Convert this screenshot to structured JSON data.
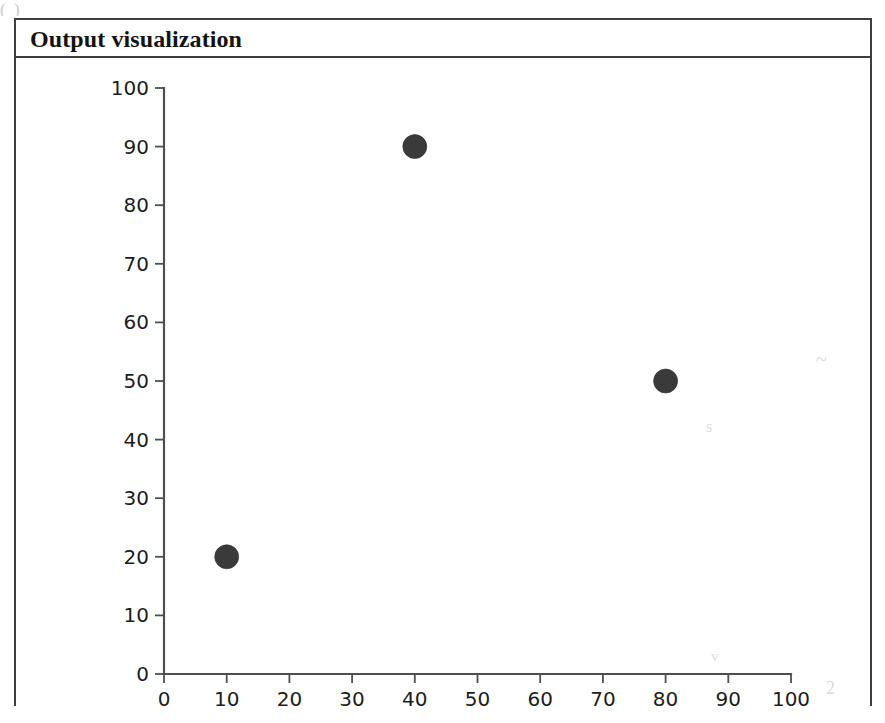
{
  "page": {
    "scan_artifact_top": "(                    )"
  },
  "figure": {
    "title": "Output visualization"
  },
  "smudges": [
    {
      "text": "~",
      "left": 800,
      "top": 290,
      "size": 20
    },
    {
      "text": "s",
      "left": 690,
      "top": 360,
      "size": 16
    },
    {
      "text": "v",
      "left": 695,
      "top": 590,
      "size": 15
    },
    {
      "text": "2",
      "left": 810,
      "top": 620,
      "size": 18
    }
  ],
  "chart_data": {
    "type": "scatter",
    "title": "Output visualization",
    "xlabel": "",
    "ylabel": "",
    "xlim": [
      0,
      100
    ],
    "ylim": [
      0,
      100
    ],
    "grid": false,
    "legend": null,
    "xticks": [
      0,
      10,
      20,
      30,
      40,
      50,
      60,
      70,
      80,
      90,
      100
    ],
    "yticks": [
      0,
      10,
      20,
      30,
      40,
      50,
      60,
      70,
      80,
      90,
      100
    ],
    "xtick_labels": [
      "0",
      "10",
      "20",
      "30",
      "40",
      "50",
      "60",
      "70",
      "80",
      "90",
      "100"
    ],
    "ytick_labels": [
      "0",
      "10",
      "20",
      "30",
      "40",
      "50",
      "60",
      "70",
      "80",
      "90",
      "100"
    ],
    "marker": "circle",
    "marker_color": "#3a3a3a",
    "marker_size": 24,
    "series": [
      {
        "name": "points",
        "points": [
          {
            "x": 10,
            "y": 20
          },
          {
            "x": 40,
            "y": 90
          },
          {
            "x": 80,
            "y": 50
          }
        ]
      }
    ]
  }
}
